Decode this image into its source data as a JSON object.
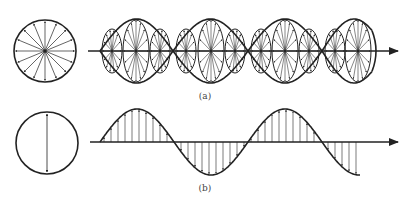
{
  "figure": {
    "stroke_color": "#222222",
    "background": "#ffffff",
    "panel_a": {
      "label": "(a)",
      "label_pos": [
        205,
        91
      ],
      "description": "Unpolarized light: random transverse E-field directions propagating along axis",
      "axis_y": 51,
      "axis_x": [
        88,
        398
      ],
      "circle": {
        "cx": 45,
        "cy": 51,
        "r": 31,
        "arrow_count": 16
      },
      "envelope_amplitude": 32,
      "nodes": [
        100,
        173,
        248,
        322
      ],
      "envelope_end": 372,
      "ellipses": [
        {
          "cx": 112,
          "rx": 10,
          "ry": 22,
          "arrows": 14
        },
        {
          "cx": 136,
          "rx": 13,
          "ry": 31,
          "arrows": 16
        },
        {
          "cx": 160,
          "rx": 10,
          "ry": 22,
          "arrows": 14
        },
        {
          "cx": 186,
          "rx": 10,
          "ry": 22,
          "arrows": 14
        },
        {
          "cx": 211,
          "rx": 13,
          "ry": 31,
          "arrows": 16
        },
        {
          "cx": 235,
          "rx": 10,
          "ry": 22,
          "arrows": 14
        },
        {
          "cx": 261,
          "rx": 10,
          "ry": 22,
          "arrows": 14
        },
        {
          "cx": 285,
          "rx": 13,
          "ry": 31,
          "arrows": 16
        },
        {
          "cx": 309,
          "rx": 10,
          "ry": 22,
          "arrows": 14
        },
        {
          "cx": 335,
          "rx": 10,
          "ry": 22,
          "arrows": 14
        },
        {
          "cx": 358,
          "rx": 13,
          "ry": 31,
          "arrows": 16
        }
      ]
    },
    "panel_b": {
      "label": "(b)",
      "label_pos": [
        205,
        183
      ],
      "description": "Linearly (plane) polarized light: E-field oscillates in a single plane",
      "axis_y": 142,
      "axis_x": [
        90,
        398
      ],
      "circle": {
        "cx": 47,
        "cy": 143,
        "r": 31
      },
      "wave": {
        "x_start": 100,
        "x_end": 360,
        "half_period": 74,
        "amplitude": 33,
        "vector_spacing": 7
      }
    }
  }
}
